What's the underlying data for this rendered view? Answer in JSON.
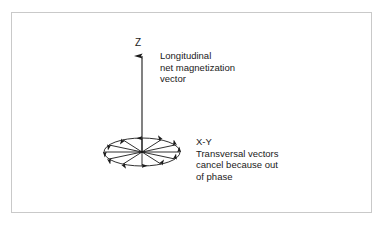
{
  "figure": {
    "name": "net-magnetization-vector-diagram",
    "border_color": "#c9c9c9",
    "background_color": "#ffffff",
    "stroke_color": "#1a1a1a"
  },
  "axes": {
    "z_label": "Z",
    "xy_label": "X-Y"
  },
  "annotations": {
    "longitudinal": {
      "line1": "Longitudinal",
      "line2": "net magnetization",
      "line3": "vector"
    },
    "transversal": {
      "line1": "X-Y",
      "line2": "Transversal vectors",
      "line3": "cancel because out",
      "line4": "of phase"
    }
  },
  "geometry": {
    "ellipse_center_x": 142,
    "ellipse_center_y": 152,
    "ellipse_rx": 38,
    "ellipse_ry": 14,
    "z_arrow_top_y": 56,
    "transversal_vector_count": 12
  }
}
